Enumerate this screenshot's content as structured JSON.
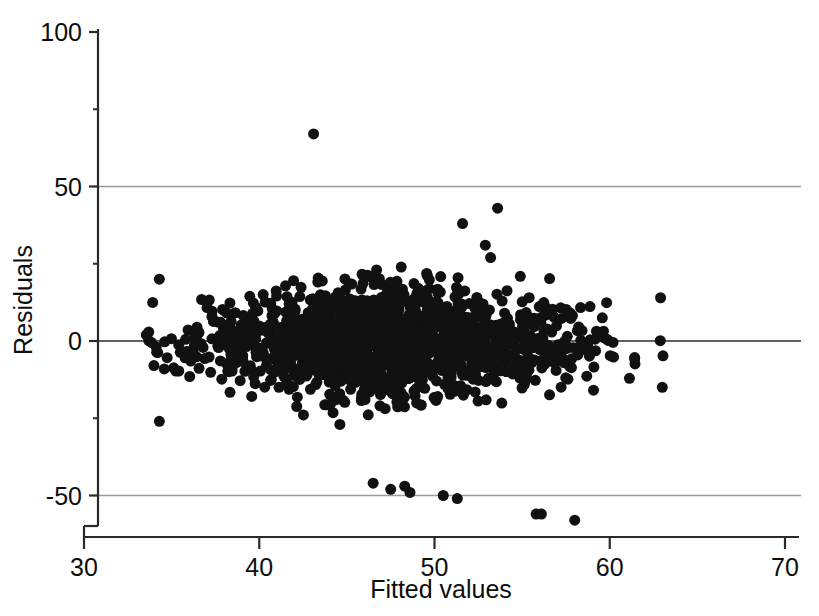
{
  "chart_data": {
    "type": "scatter",
    "title": "",
    "subtitle": "",
    "xlabel": "Fitted values",
    "ylabel": "Residuals",
    "xlim": [
      30,
      70
    ],
    "ylim": [
      -62,
      103
    ],
    "x_ticks": [
      30,
      40,
      50,
      60,
      70
    ],
    "x_tick_labels": [
      "30",
      "40",
      "50",
      "60",
      "70"
    ],
    "y_ticks": [
      -50,
      0,
      50,
      100
    ],
    "y_tick_labels": [
      "-50",
      "0",
      "50",
      "100"
    ],
    "y_minor_ticks": [
      -25,
      25,
      75
    ],
    "grid": "horizontal gridlines at y = -50, 0, 50 only; no vertical gridlines",
    "gridline_values": [
      -50,
      0,
      50
    ],
    "legend": "none",
    "marker": {
      "shape": "circle",
      "filled": true,
      "color": "#111111",
      "size_px": 11
    },
    "point_count": 1500,
    "band": {
      "x_start": 33.5,
      "x_end": 63.2,
      "x_dense_start": 39.0,
      "x_dense_end": 55.0,
      "typical_spread": 11,
      "max_spread": 24
    },
    "outliers": [
      {
        "x": 43.1,
        "y": 67,
        "note": "large positive outlier, top of plot"
      },
      {
        "x": 53.6,
        "y": 43
      },
      {
        "x": 51.6,
        "y": 38
      },
      {
        "x": 52.9,
        "y": 31
      },
      {
        "x": 53.2,
        "y": 27
      },
      {
        "x": 46.5,
        "y": -46
      },
      {
        "x": 47.5,
        "y": -48
      },
      {
        "x": 48.3,
        "y": -47
      },
      {
        "x": 48.6,
        "y": -49
      },
      {
        "x": 50.5,
        "y": -50
      },
      {
        "x": 51.3,
        "y": -51
      },
      {
        "x": 55.8,
        "y": -56
      },
      {
        "x": 56.1,
        "y": -56
      },
      {
        "x": 58.0,
        "y": -58
      },
      {
        "x": 34.3,
        "y": -26
      },
      {
        "x": 44.6,
        "y": -27
      },
      {
        "x": 34.3,
        "y": 20
      },
      {
        "x": 62.9,
        "y": 14
      },
      {
        "x": 63.0,
        "y": -15
      }
    ],
    "reference_line": {
      "y": 0,
      "style": "solid thin dark line across full plot width"
    }
  },
  "axes": {
    "x_axis_label": "Fitted values",
    "y_axis_label": "Residuals"
  },
  "colors": {
    "background": "#ffffff",
    "marker": "#111111",
    "axis": "#2a2a2a",
    "gridline": "#9a9a9a",
    "text": "#0d0d0d"
  }
}
